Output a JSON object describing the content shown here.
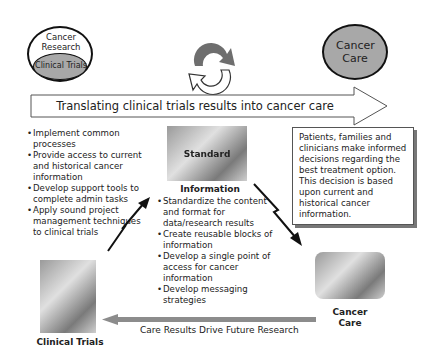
{
  "research_circle": {
    "outer_label": "Cancer Research",
    "inner_label": "Clinical Trials"
  },
  "cycle_icon": "refresh-cycle-icon",
  "care_circle": {
    "label": "Cancer Care"
  },
  "main_arrow": {
    "label": "Translating clinical trials results into cancer care"
  },
  "clinical_trials_bullets": [
    "Implement common processes",
    "Provide access to current and historical cancer information",
    "Develop support tools to complete admin tasks",
    "Apply sound project management techniques to clinical trials"
  ],
  "standard_info": {
    "photo_overlay_label": "Standard",
    "title": "Information",
    "bullets": [
      "Standardize the content and format for data/research results",
      "Create reusable blocks of information",
      "Develop a single point of access for cancer information",
      "Develop messaging strategies"
    ]
  },
  "patients_box": {
    "text": "Patients, families and clinicians make informed decisions regarding the best treatment option. This decision is based upon current and historical cancer information."
  },
  "clinical_trials_photo": {
    "caption": "Clinical Trials"
  },
  "cancer_care_photo": {
    "caption_line1": "Cancer",
    "caption_line2": "Care"
  },
  "feedback_arrow": {
    "label": "Care Results Drive Future Research"
  },
  "colors": {
    "circle_fill": "#a8a8a8",
    "arrow_gray": "#8c8c8c",
    "cycle_dark": "#6e6e6e"
  }
}
